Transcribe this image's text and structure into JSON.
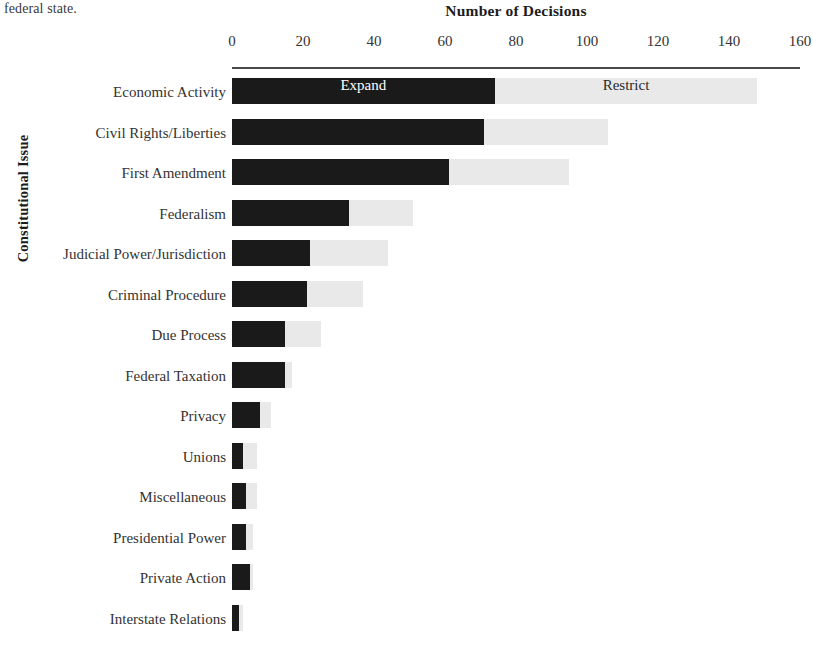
{
  "page_fragment": "federal state.",
  "chart_data": {
    "type": "bar",
    "orientation": "horizontal",
    "stacked": true,
    "title": "Number of Decisions",
    "xlabel": "Number of Decisions",
    "ylabel": "Constitutional Issue",
    "xlim": [
      0,
      160
    ],
    "xticks": [
      0,
      20,
      40,
      60,
      80,
      100,
      120,
      140,
      160
    ],
    "xtick_labels": [
      "0",
      "20",
      "40",
      "60",
      "80",
      "100",
      "120",
      "140",
      "160"
    ],
    "grid": false,
    "legend_position": "in-bars-first-row",
    "categories": [
      "Economic Activity",
      "Civil Rights/Liberties",
      "First Amendment",
      "Federalism",
      "Judicial Power/Jurisdiction",
      "Criminal Procedure",
      "Due Process",
      "Federal Taxation",
      "Privacy",
      "Unions",
      "Miscellaneous",
      "Presidential Power",
      "Private Action",
      "Interstate Relations"
    ],
    "series": [
      {
        "name": "Expand",
        "color": "#1a1a1a",
        "values": [
          74,
          71,
          61,
          33,
          22,
          21,
          15,
          15,
          8,
          3,
          4,
          4,
          5,
          2
        ]
      },
      {
        "name": "Restrict",
        "color": "#e9e9e9",
        "values": [
          74,
          35,
          34,
          18,
          22,
          16,
          10,
          2,
          3,
          4,
          3,
          2,
          1,
          1
        ]
      }
    ],
    "annotations": [
      {
        "text": "Expand",
        "row": 0,
        "series": "Expand"
      },
      {
        "text": "Restrict",
        "row": 0,
        "series": "Restrict"
      }
    ]
  }
}
